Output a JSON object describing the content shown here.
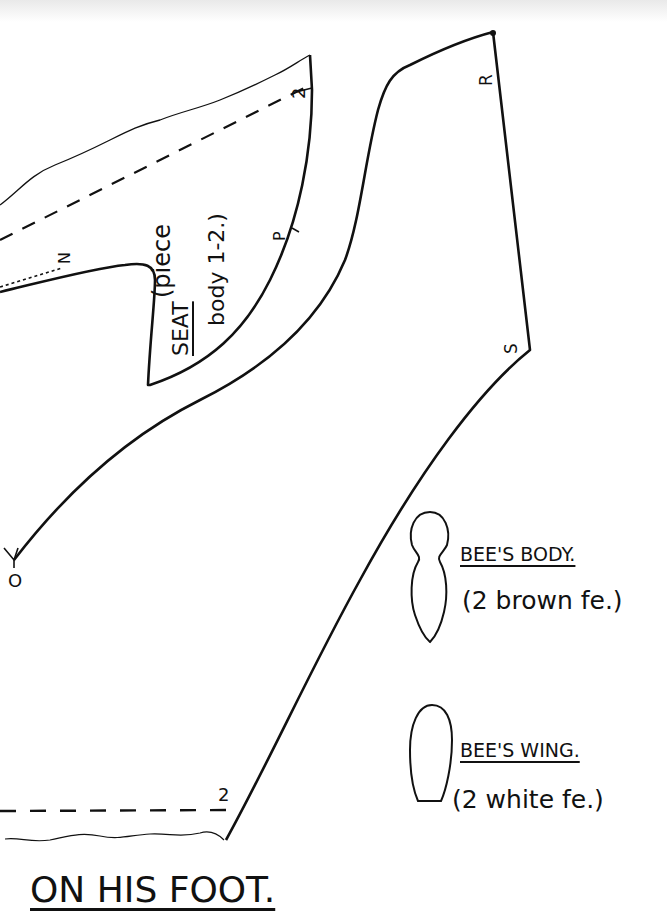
{
  "pieces": {
    "seat": {
      "title": "SEAT",
      "line1": "(piece",
      "line2": "body 1-2.)"
    },
    "main_body": {
      "points": {
        "R": "R",
        "S": "S",
        "P": "P",
        "N": "N",
        "O": "O",
        "two_top": "2",
        "two_bottom": "2"
      }
    },
    "bee_body": {
      "title": "BEE'S BODY.",
      "note": "(2 brown fe.)"
    },
    "bee_wing": {
      "title": "BEE'S WING.",
      "note": "(2 white fe.)"
    }
  },
  "caption": "ON HIS FOOT.",
  "colors": {
    "ink": "#111111",
    "paper": "#ffffff"
  }
}
